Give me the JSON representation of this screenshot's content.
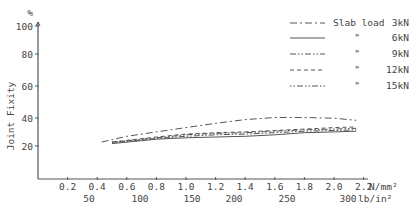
{
  "chart_data": {
    "type": "line",
    "title": "",
    "xlabel": "N/mm² (lb/in²)",
    "ylabel": "Joint Fixity",
    "y_unit": "%",
    "xlim": [
      0,
      2.2
    ],
    "ylim": [
      0,
      100
    ],
    "x_ticks": [
      "0.2",
      "0.4",
      "0.6",
      "0.8",
      "1.0",
      "1.2",
      "1.4",
      "1.6",
      "1.8",
      "2.0",
      "2.2"
    ],
    "x_ticks_values": [
      0.2,
      0.4,
      0.6,
      0.8,
      1.0,
      1.2,
      1.4,
      1.6,
      1.8,
      2.0,
      2.2
    ],
    "x_unit_primary": "N/mm²",
    "x_ticks_secondary": [
      "50",
      "100",
      "150",
      "200",
      "250",
      "300"
    ],
    "x_unit_secondary": "lb/in²",
    "y_ticks": [
      "20",
      "40",
      "60",
      "80",
      "100"
    ],
    "y_ticks_values": [
      20,
      40,
      60,
      80,
      100
    ],
    "grid": false,
    "legend_position": "top-right",
    "series": [
      {
        "name": "Slab load 3kN",
        "style": "dash-dot",
        "x": [
          0.43,
          0.6,
          0.8,
          1.0,
          1.2,
          1.4,
          1.6,
          1.8,
          2.0,
          2.15
        ],
        "values": [
          22,
          26,
          29,
          32,
          35,
          37.5,
          39,
          39,
          38.5,
          37
        ]
      },
      {
        "name": "6kN",
        "style": "solid",
        "x": [
          0.5,
          0.8,
          1.0,
          1.2,
          1.4,
          1.6,
          1.8,
          2.0,
          2.15
        ],
        "values": [
          21,
          24,
          25,
          25.5,
          26,
          27,
          28.5,
          29,
          29.5
        ]
      },
      {
        "name": "9kN",
        "style": "dash-dot-dot",
        "x": [
          0.5,
          0.8,
          1.0,
          1.2,
          1.4,
          1.6,
          1.8,
          2.0,
          2.15
        ],
        "values": [
          22,
          25,
          27,
          28,
          28.5,
          29.5,
          30.5,
          31,
          31.5
        ]
      },
      {
        "name": "12kN",
        "style": "dashed",
        "x": [
          0.5,
          0.8,
          1.0,
          1.2,
          1.4,
          1.6,
          1.8,
          2.0,
          2.15
        ],
        "values": [
          22,
          25.5,
          27.5,
          28.5,
          29,
          30,
          31,
          32,
          32.5
        ]
      },
      {
        "name": "15kN",
        "style": "dotted-dash",
        "x": [
          0.5,
          0.8,
          1.0,
          1.2,
          1.4,
          1.6,
          1.8,
          2.0,
          2.15
        ],
        "values": [
          21.5,
          24.5,
          26,
          27,
          27.5,
          28.5,
          29.5,
          30,
          30.5
        ]
      }
    ]
  },
  "legend": [
    {
      "prefix": "Slab load",
      "value": "3kN"
    },
    {
      "prefix": "\"",
      "value": "6kN"
    },
    {
      "prefix": "\"",
      "value": "9kN"
    },
    {
      "prefix": "\"",
      "value": "12kN"
    },
    {
      "prefix": "\"",
      "value": "15kN"
    }
  ],
  "axis": {
    "y_title": "Joint Fixity",
    "y_unit": "%",
    "x_unit_primary": "N/mm²",
    "x_unit_secondary": "lb/in²"
  }
}
